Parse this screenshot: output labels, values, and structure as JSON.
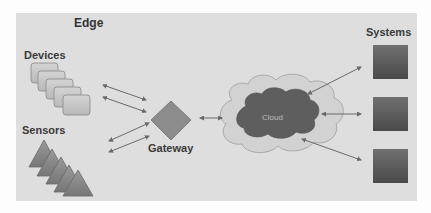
{
  "diagram": {
    "section_title": "Edge",
    "nodes": {
      "devices": {
        "label": "Devices",
        "count": 5,
        "shape": "rounded-rect"
      },
      "sensors": {
        "label": "Sensors",
        "count": 5,
        "shape": "triangle"
      },
      "gateway": {
        "label": "Gateway",
        "shape": "diamond"
      },
      "cloud": {
        "label": "Cloud",
        "shape": "cloud"
      },
      "systems": {
        "label": "Systems",
        "count": 3,
        "shape": "square"
      }
    },
    "edges": [
      {
        "from": "devices",
        "to": "gateway",
        "bidirectional": true,
        "count": 2
      },
      {
        "from": "sensors",
        "to": "gateway",
        "bidirectional": true,
        "count": 2
      },
      {
        "from": "gateway",
        "to": "cloud",
        "bidirectional": true,
        "count": 1
      },
      {
        "from": "cloud",
        "to": "systems.0",
        "bidirectional": true
      },
      {
        "from": "cloud",
        "to": "systems.1",
        "bidirectional": true
      },
      {
        "from": "cloud",
        "to": "systems.2",
        "bidirectional": true
      }
    ],
    "colors": {
      "panel": "#dedede",
      "device_fill": "#c8c8c8",
      "sensor_fill": "#8a8a8a",
      "gateway_fill": "#8c8c8c",
      "cloud_outer": "#cfcfcf",
      "cloud_inner": "#5e5e5e",
      "system_fill": "#555555",
      "arrow": "#6a6a6a"
    }
  }
}
